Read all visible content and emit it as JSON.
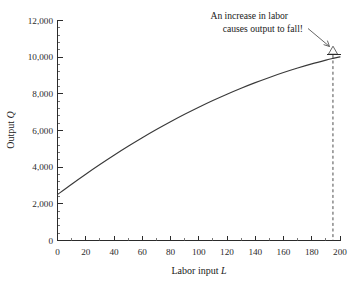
{
  "chart_data": {
    "type": "line",
    "title": "",
    "xlabel": "Labor input L",
    "xlabel_text": "Labor input ",
    "xlabel_symbol": "L",
    "ylabel": "Output Q",
    "ylabel_text": "Output ",
    "ylabel_symbol": "Q",
    "xlim": [
      0,
      200
    ],
    "ylim": [
      0,
      12000
    ],
    "grid": false,
    "legend_position": "none",
    "x_ticks": [
      0,
      20,
      40,
      60,
      80,
      100,
      120,
      140,
      160,
      180,
      200
    ],
    "x_tick_labels": [
      "0",
      "20",
      "40",
      "60",
      "80",
      "100",
      "120",
      "140",
      "160",
      "180",
      "200"
    ],
    "y_ticks": [
      0,
      2000,
      4000,
      6000,
      8000,
      10000,
      12000
    ],
    "y_tick_labels": [
      "0",
      "2,000",
      "4,000",
      "6,000",
      "8,000",
      "10,000",
      "12,000"
    ],
    "y_minor_tick_step": 400,
    "x_minor_tick_step": 10,
    "series": [
      {
        "name": "Total product curve",
        "color": "#3a3a3a",
        "x": [
          0,
          10,
          20,
          30,
          40,
          50,
          60,
          70,
          80,
          90,
          100,
          110,
          120,
          130,
          140,
          150,
          160,
          170,
          180,
          190,
          195,
          200
        ],
        "values": [
          2500,
          3065,
          3610,
          4135,
          4640,
          5125,
          5590,
          6035,
          6460,
          6865,
          7250,
          7615,
          7960,
          8285,
          8590,
          8875,
          9140,
          9385,
          9610,
          9815,
          9910,
          9995
        ]
      }
    ],
    "peak": {
      "x": 195,
      "y": 10100,
      "marker": "open-triangle-up"
    },
    "drop_line": {
      "x": 195,
      "from_y": 10100,
      "to_y": 0,
      "style": "dashed"
    },
    "annotations": [
      {
        "name": "labor-fall-annotation",
        "lines": [
          "An increase in labor",
          "causes output to fall!"
        ],
        "arrow_to_x": 195,
        "arrow_to_y": 10100
      }
    ]
  },
  "axes": {
    "y_title_prefix": "Output ",
    "y_title_symbol": "Q",
    "x_title_prefix": "Labor input ",
    "x_title_symbol": "L"
  },
  "annotation": {
    "line1": "An increase in labor",
    "line2": "causes output to fall!"
  },
  "ticks": {
    "y": [
      "12,000",
      "10,000",
      "8,000",
      "6,000",
      "4,000",
      "2,000",
      "0"
    ],
    "x": [
      "0",
      "20",
      "40",
      "60",
      "80",
      "100",
      "120",
      "140",
      "160",
      "180",
      "200"
    ]
  },
  "colors": {
    "curve": "#3a3a3a",
    "axis": "#2b2b2b",
    "text": "#1a1a1a",
    "annotation_arrow": "#555555",
    "background": "#ffffff"
  }
}
